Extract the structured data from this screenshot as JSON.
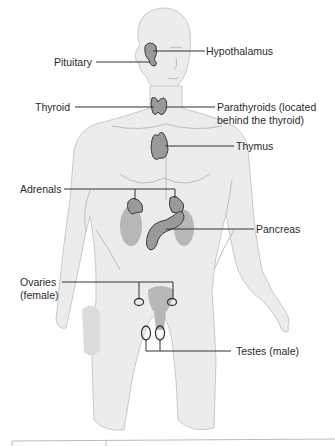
{
  "figure": {
    "labels": {
      "hypothalamus": "Hypothalamus",
      "pituitary": "Pituitary",
      "thyroid": "Thyroid",
      "parathyroids_line1": "Parathyroids (located",
      "parathyroids_line2": "behind the thyroid)",
      "thymus": "Thymus",
      "adrenals": "Adrenals",
      "pancreas": "Pancreas",
      "ovaries_line1": "Ovaries",
      "ovaries_line2": "(female)",
      "testes": "Testes (male)"
    },
    "colors": {
      "body": "#ececec",
      "body_outline": "#c9c9c9",
      "gland": "#9a9a9a",
      "gland_outline": "#3a3a3a",
      "kidney": "#b7b7b7",
      "leader_line": "#333333",
      "text": "#2b2b2b"
    }
  }
}
